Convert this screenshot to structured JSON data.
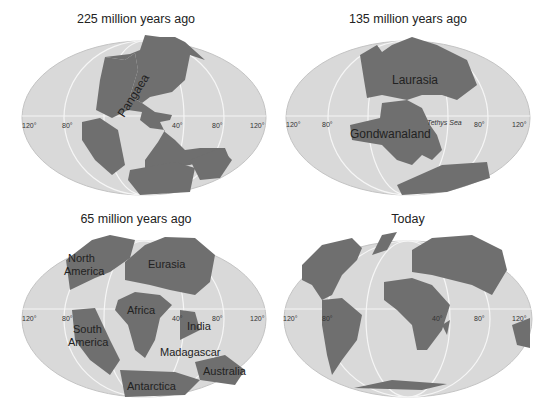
{
  "colors": {
    "ocean": "#d9d9d9",
    "ocean_edge": "#c8c8c8",
    "land": "#6f6f6f",
    "land_edge": "#e6e6e6",
    "grid": "#f4f4f4",
    "text": "#222222"
  },
  "panels": [
    {
      "title": "225 million years ago",
      "ticks": [
        "120°",
        "80°",
        "40°",
        "80°",
        "120°"
      ],
      "labels": [
        "Pangaea"
      ]
    },
    {
      "title": "135 million years ago",
      "ticks": [
        "120°",
        "80°",
        "80°",
        "120°"
      ],
      "labels": [
        "Laurasia",
        "Gondwanaland",
        "Tethys Sea"
      ]
    },
    {
      "title": "65 million years ago",
      "ticks": [
        "120°",
        "80°",
        "40°",
        "80°",
        "120°"
      ],
      "labels": [
        "North",
        "America",
        "Eurasia",
        "Africa",
        "South",
        "America",
        "India",
        "Madagascar",
        "Australia",
        "Antarctica"
      ]
    },
    {
      "title": "Today",
      "ticks": [
        "120°",
        "80°",
        "40°",
        "80°",
        "120°"
      ],
      "labels": []
    }
  ]
}
